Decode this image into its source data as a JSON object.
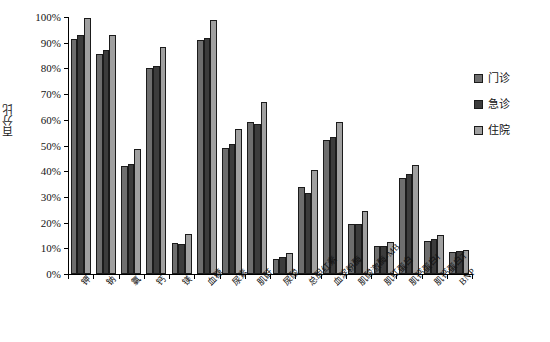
{
  "chart_data": {
    "type": "bar",
    "title": "",
    "subtitle": "",
    "xlabel": "",
    "ylabel": "百分比",
    "ylim": [
      0,
      100
    ],
    "ytick_labels": [
      "0%",
      "10%",
      "20%",
      "30%",
      "40%",
      "50%",
      "60%",
      "70%",
      "80%",
      "90%",
      "100%"
    ],
    "ytick_values": [
      0,
      10,
      20,
      30,
      40,
      50,
      60,
      70,
      80,
      90,
      100
    ],
    "grid": false,
    "legend_position": "right",
    "unit": "%",
    "categories": [
      "钾",
      "钠",
      "氯",
      "钙",
      "镁",
      "血糖",
      "尿素",
      "肌酐",
      "尿酸",
      "总胆红素",
      "血淀粉酶",
      "肌酸激酶-MB",
      "肌红蛋白",
      "肌钙蛋白I",
      "肌钙蛋白T",
      "BNP"
    ],
    "series": [
      {
        "name": "门诊",
        "color": "#6e6e6e",
        "values": [
          91.5,
          85.5,
          42.0,
          80.0,
          12.0,
          91.0,
          49.0,
          59.0,
          6.0,
          34.0,
          52.0,
          19.5,
          11.0,
          37.5,
          13.0,
          8.5
        ]
      },
      {
        "name": "急诊",
        "color": "#3c3c3c",
        "values": [
          93.0,
          87.0,
          43.0,
          81.0,
          11.5,
          92.0,
          50.5,
          58.5,
          6.5,
          31.5,
          53.5,
          19.5,
          11.0,
          39.0,
          13.5,
          9.0
        ]
      },
      {
        "name": "住院",
        "color": "#a0a0a0",
        "values": [
          99.5,
          93.0,
          48.5,
          88.5,
          15.5,
          99.0,
          56.5,
          67.0,
          8.0,
          40.5,
          59.0,
          24.5,
          12.5,
          42.5,
          15.0,
          9.5
        ]
      }
    ]
  },
  "legend": {
    "items": [
      {
        "label": "门诊",
        "swatch": "legend-swatch-outpatient"
      },
      {
        "label": "急诊",
        "swatch": "legend-swatch-emergency"
      },
      {
        "label": "住院",
        "swatch": "legend-swatch-inpatient"
      }
    ]
  }
}
